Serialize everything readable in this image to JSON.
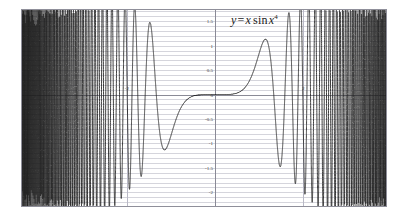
{
  "chart_data": {
    "type": "line",
    "title": "",
    "annotation": "y = x sin x^4",
    "equation": {
      "lhs": "y",
      "equals": "=",
      "var1": "x",
      "fn": "sin",
      "var2": "x",
      "exponent": "4"
    },
    "xlabel": "",
    "ylabel": "",
    "xlim": [
      -4.4,
      3.9
    ],
    "ylim": [
      -2.3,
      1.75
    ],
    "grid": true,
    "grid_minor_y_step": 0.1,
    "legend": "none",
    "x_ticks": [
      {
        "value": -2,
        "label": "-2"
      },
      {
        "value": 2,
        "label": "2"
      }
    ],
    "y_ticks": [
      {
        "value": 1.5,
        "label": "1.5"
      },
      {
        "value": 1,
        "label": "1"
      },
      {
        "value": 0.5,
        "label": "0.5"
      },
      {
        "value": 0,
        "label": "0"
      },
      {
        "value": -0.5,
        "label": "-0.5"
      },
      {
        "value": -1,
        "label": "-1"
      },
      {
        "value": -1.5,
        "label": "-1.5"
      },
      {
        "value": -2,
        "label": "-2"
      }
    ],
    "series": [
      {
        "name": "y = x sin x^4",
        "formula": "x*sin(x^4)",
        "color": "#1c1c1c",
        "samples": 24000,
        "x_start": -4.4,
        "x_end": 3.9,
        "notable_points": [
          {
            "x": -1.78,
            "y": 1.5,
            "kind": "local-max"
          },
          {
            "x": -1.4,
            "y": -1.15,
            "kind": "local-min"
          },
          {
            "x": -0.6,
            "y": -0.05,
            "kind": "flat"
          },
          {
            "x": 0,
            "y": 0,
            "kind": "origin"
          },
          {
            "x": 1.4,
            "y": 1.1,
            "kind": "local-max"
          },
          {
            "x": 1.78,
            "y": -1.5,
            "kind": "local-min"
          },
          {
            "x": 2.05,
            "y": 1.6,
            "kind": "local-max"
          },
          {
            "x": 2.2,
            "y": -2.1,
            "kind": "local-min"
          }
        ]
      }
    ],
    "colors": {
      "curve": "#1c1c1c",
      "grid": "#b9b9c6",
      "axis": "#8a8a96",
      "frame": "#8f8f9a",
      "background": "#ffffff",
      "text": "#3a3a3a"
    }
  }
}
